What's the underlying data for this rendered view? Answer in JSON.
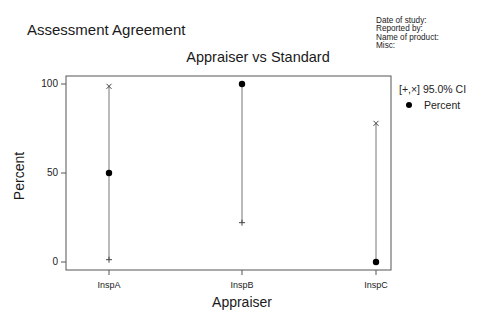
{
  "header": {
    "title": "Assessment Agreement",
    "meta": [
      "Date of study:",
      "Reported by:",
      "Name of product:",
      "Misc:"
    ]
  },
  "legend": {
    "ci_label": "[+,×] 95.0% CI",
    "point_label": "Percent"
  },
  "chart_data": {
    "type": "scatter",
    "title": "Appraiser vs Standard",
    "xlabel": "Appraiser",
    "ylabel": "Percent",
    "categories": [
      "InspA",
      "InspB",
      "InspC"
    ],
    "ylim": [
      0,
      100
    ],
    "yticks": [
      0,
      50,
      100
    ],
    "grid": false,
    "legend_position": "right",
    "series": [
      {
        "name": "Percent",
        "marker": "dot",
        "values": [
          50,
          100,
          0
        ]
      },
      {
        "name": "95.0% CI lower (+)",
        "marker": "plus",
        "values": [
          1.3,
          22.1,
          0
        ]
      },
      {
        "name": "95.0% CI upper (×)",
        "marker": "x",
        "values": [
          98.7,
          100,
          77.9
        ]
      }
    ]
  },
  "colors": {
    "frame": "#555555",
    "ci_line": "#777777",
    "point": "#000000"
  }
}
